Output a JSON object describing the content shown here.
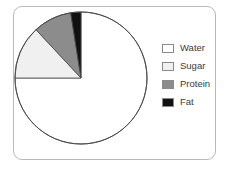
{
  "frame": {
    "border_color": "#b9b9b9",
    "background": "#ffffff"
  },
  "legend": {
    "position": "right",
    "items": [
      {
        "label": "Water",
        "color": "#ffffff",
        "swatch_name": "legend-swatch-water"
      },
      {
        "label": "Sugar",
        "color": "#f0f0f0",
        "swatch_name": "legend-swatch-sugar"
      },
      {
        "label": "Protein",
        "color": "#8c8c8c",
        "swatch_name": "legend-swatch-protein"
      },
      {
        "label": "Fat",
        "color": "#111111",
        "swatch_name": "legend-swatch-fat"
      }
    ]
  },
  "chart_data": {
    "type": "pie",
    "title": "",
    "xlabel": "",
    "ylabel": "",
    "legend_position": "right",
    "grid": false,
    "direction": "counterclockwise",
    "start_angle_deg": 0,
    "categories": [
      "Water",
      "Sugar",
      "Protein",
      "Fat"
    ],
    "values": [
      75,
      13,
      9.5,
      2.5
    ],
    "colors": [
      "#ffffff",
      "#f0f0f0",
      "#8c8c8c",
      "#111111"
    ],
    "slices": [
      {
        "label": "Water",
        "value": 75,
        "color": "#ffffff",
        "start_deg": 90,
        "end_deg": 360
      },
      {
        "label": "Sugar",
        "value": 13,
        "color": "#f0f0f0",
        "start_deg": 43,
        "end_deg": 90
      },
      {
        "label": "Protein",
        "value": 9.5,
        "color": "#8c8c8c",
        "start_deg": 9,
        "end_deg": 43
      },
      {
        "label": "Fat",
        "value": 2.5,
        "color": "#111111",
        "start_deg": 0,
        "end_deg": 9
      }
    ]
  }
}
